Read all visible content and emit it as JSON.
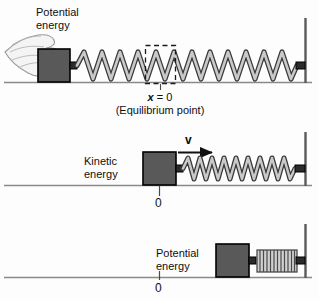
{
  "figure": {
    "title_semantic": "spring-energy-diagram",
    "colors": {
      "block_fill": "#595959",
      "block_edge": "#000000",
      "spring_fill": "#c6c6c6",
      "spring_edge": "#3a3a3a",
      "baseline": "#7a7a7a",
      "wall": "#5a5a5a",
      "hand_fill": "#f2f2f2",
      "hand_edge": "#9a9a9a",
      "text": "#0f0f0f",
      "dashed_box": "#1a1a1a"
    }
  },
  "panels": [
    {
      "id": "panel-compressed-left",
      "energy_label_line1": "Potential",
      "energy_label_line2": "energy",
      "marker_label": "x = 0",
      "marker_label_italic_part": "x",
      "marker_sublabel": "(Equilibrium point)",
      "has_hand": true,
      "has_dashed_box": true,
      "spring_state": "stretched",
      "block_position": "left-of-equilibrium"
    },
    {
      "id": "panel-kinetic-middle",
      "energy_label_line1": "Kinetic",
      "energy_label_line2": "energy",
      "velocity_label": "v",
      "marker_label": "0",
      "spring_state": "stretched",
      "block_position": "at-equilibrium"
    },
    {
      "id": "panel-compressed-right",
      "energy_label_line1": "Potential",
      "energy_label_line2": "energy",
      "marker_label": "0",
      "spring_state": "compressed",
      "block_position": "right-of-equilibrium"
    }
  ]
}
